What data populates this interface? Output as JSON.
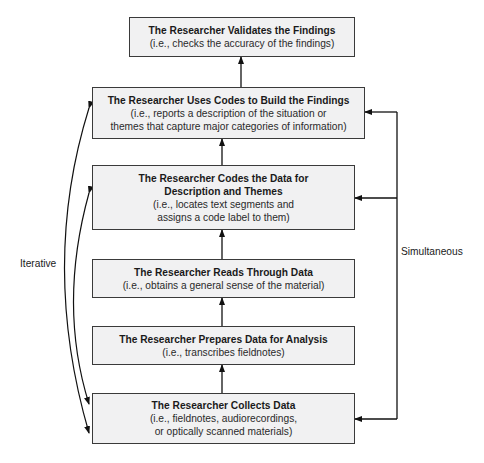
{
  "diagram": {
    "steps": [
      {
        "id": "validate",
        "title": "The Researcher Validates the Findings",
        "desc_lines": [
          "(i.e., checks the accuracy of the findings)"
        ]
      },
      {
        "id": "build",
        "title": "The Researcher Uses Codes to Build the Findings",
        "desc_lines": [
          "(i.e., reports a description of the situation or",
          "themes that capture major categories of information)"
        ]
      },
      {
        "id": "code",
        "title_lines": [
          "The Researcher Codes the Data for",
          "Description and Themes"
        ],
        "desc_lines": [
          "(i.e., locates text segments and",
          "assigns a code label to them)"
        ]
      },
      {
        "id": "read",
        "title": "The Researcher Reads Through Data",
        "desc_lines": [
          "(i.e., obtains a general sense of the material)"
        ]
      },
      {
        "id": "prepare",
        "title": "The Researcher Prepares Data for Analysis",
        "desc_lines": [
          "(i.e., transcribes fieldnotes)"
        ]
      },
      {
        "id": "collect",
        "title": "The Researcher Collects Data",
        "desc_lines": [
          "(i.e., fieldnotes, audiorecordings,",
          "or optically scanned materials)"
        ]
      }
    ],
    "labels": {
      "left": "Iterative",
      "right": "Simultaneous"
    },
    "colors": {
      "box_fill": "#f1f1f2",
      "box_border": "#3a3a3a",
      "line": "#111111"
    }
  }
}
